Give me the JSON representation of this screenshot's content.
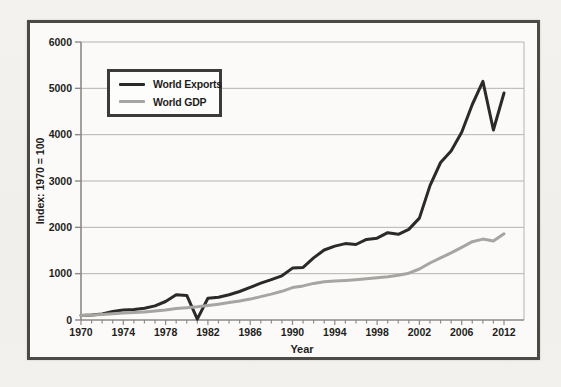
{
  "colors": {
    "page_background": "#f2f0ec",
    "frame_border": "#4b4a47",
    "plot_background": "#fbfaf8",
    "gridline": "#b5b3af",
    "axis": "#8b8a86",
    "text": "#1f1e1c",
    "exports_line": "#2b2a28",
    "gdp_line": "#a6a5a2"
  },
  "legend": {
    "items": [
      {
        "label": "World Exports"
      },
      {
        "label": "World GDP"
      }
    ]
  },
  "chart_data": {
    "type": "line",
    "title": "",
    "xlabel": "Year",
    "ylabel": "Index: 1970 = 100",
    "ylim": [
      0,
      6000
    ],
    "yticks": [
      0,
      1000,
      2000,
      3000,
      4000,
      5000,
      6000
    ],
    "grid": "horizontal",
    "legend_position": "upper-left",
    "x": [
      1970,
      1971,
      1972,
      1973,
      1974,
      1975,
      1976,
      1977,
      1978,
      1979,
      1980,
      1981,
      1982,
      1983,
      1984,
      1985,
      1986,
      1987,
      1988,
      1989,
      1990,
      1991,
      1992,
      1993,
      1994,
      1995,
      1996,
      1997,
      1998,
      1999,
      2000,
      2001,
      2002,
      2003,
      2004,
      2005,
      2006,
      2007,
      2008,
      2009,
      2010
    ],
    "xtick_every": 4,
    "xtick_labels": [
      "1970",
      "1974",
      "1978",
      "1982",
      "1986",
      "1990",
      "1994",
      "1998",
      "2002",
      "2006",
      "2012"
    ],
    "series": [
      {
        "name": "World Exports",
        "color": "#2b2a28",
        "values": [
          100,
          105,
          130,
          185,
          215,
          225,
          255,
          305,
          400,
          545,
          530,
          20,
          470,
          490,
          545,
          615,
          705,
          795,
          870,
          955,
          1120,
          1135,
          1340,
          1510,
          1595,
          1650,
          1630,
          1740,
          1765,
          1885,
          1850,
          1955,
          2200,
          2900,
          3400,
          3650,
          4050,
          4650,
          5150,
          4100,
          4900
        ]
      },
      {
        "name": "World GDP",
        "color": "#a6a5a2",
        "values": [
          100,
          110,
          120,
          135,
          150,
          160,
          175,
          195,
          215,
          245,
          265,
          285,
          310,
          340,
          375,
          410,
          450,
          505,
          560,
          620,
          700,
          735,
          790,
          825,
          840,
          855,
          870,
          890,
          910,
          935,
          965,
          1010,
          1100,
          1230,
          1340,
          1450,
          1570,
          1690,
          1745,
          1705,
          1860
        ]
      }
    ]
  }
}
